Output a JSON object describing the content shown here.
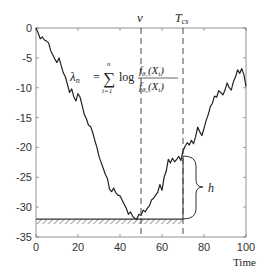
{
  "chart_data": {
    "type": "line",
    "title": "",
    "xlabel": "Time",
    "ylabel": "",
    "xlim": [
      0,
      100
    ],
    "ylim": [
      -35,
      0
    ],
    "xticks": [
      0,
      20,
      40,
      60,
      80,
      100
    ],
    "yticks": [
      0,
      -5,
      -10,
      -15,
      -20,
      -25,
      -30,
      -35
    ],
    "xtick_labels": [
      "0",
      "20",
      "40",
      "60",
      "80",
      "100"
    ],
    "ytick_labels": [
      "0",
      "-5",
      "-10",
      "-15",
      "-20",
      "-25",
      "-30",
      "-35"
    ],
    "grid": false,
    "series": [
      {
        "name": "lambda_n",
        "x": [
          0,
          1,
          2,
          3,
          4,
          5,
          6,
          7,
          8,
          9,
          10,
          11,
          12,
          13,
          14,
          15,
          16,
          17,
          18,
          19,
          20,
          21,
          22,
          23,
          24,
          25,
          26,
          27,
          28,
          29,
          30,
          31,
          32,
          33,
          34,
          35,
          36,
          37,
          38,
          39,
          40,
          41,
          42,
          43,
          44,
          45,
          46,
          47,
          48,
          49,
          50,
          51,
          52,
          53,
          54,
          55,
          56,
          57,
          58,
          59,
          60,
          61,
          62,
          63,
          64,
          65,
          66,
          67,
          68,
          69,
          70,
          71,
          72,
          73,
          74,
          75,
          76,
          77,
          78,
          79,
          80,
          81,
          82,
          83,
          84,
          85,
          86,
          87,
          88,
          89,
          90,
          91,
          92,
          93,
          94,
          95,
          96,
          97,
          98,
          99,
          100
        ],
        "values": [
          0,
          -0.8,
          -1.8,
          -1.5,
          -2.0,
          -2.2,
          -2.5,
          -3.8,
          -4.5,
          -5.2,
          -5.8,
          -5.0,
          -6.3,
          -7.5,
          -8.2,
          -9.5,
          -10.8,
          -10.2,
          -11.5,
          -12.2,
          -11.0,
          -11.6,
          -13.0,
          -14.5,
          -15.2,
          -16.3,
          -16.5,
          -17.5,
          -18.8,
          -20.0,
          -21.5,
          -22.5,
          -23.5,
          -24.5,
          -25.2,
          -27.0,
          -27.4,
          -26.8,
          -27.6,
          -28.0,
          -28.1,
          -28.8,
          -29.5,
          -30.2,
          -31.2,
          -30.8,
          -31.5,
          -31.9,
          -32.0,
          -31.2,
          -31.4,
          -30.5,
          -30.8,
          -30.2,
          -29.8,
          -28.8,
          -28.5,
          -28.0,
          -27.5,
          -26.2,
          -27.2,
          -25.0,
          -24.0,
          -22.0,
          -22.6,
          -21.8,
          -22.4,
          -22.0,
          -21.5,
          -22.2,
          -20.6,
          -19.8,
          -19.2,
          -19.6,
          -18.8,
          -19.4,
          -18.2,
          -16.6,
          -17.4,
          -18.0,
          -16.8,
          -15.5,
          -14.5,
          -13.2,
          -12.6,
          -11.4,
          -11.6,
          -10.5,
          -10.8,
          -11.2,
          -10.4,
          -9.2,
          -10.0,
          -10.4,
          -9.0,
          -8.2,
          -7.0,
          -7.6,
          -6.8,
          -7.8,
          -9.8
        ]
      }
    ],
    "annotations": [
      {
        "type": "vline",
        "x": 50,
        "style": "dashed",
        "label": "ν"
      },
      {
        "type": "vline",
        "x": 70,
        "style": "dashed",
        "label": "T_cs"
      },
      {
        "type": "hline",
        "y": -32,
        "x_range": [
          0,
          70
        ],
        "style": "solid-hatched",
        "label": "running minimum"
      },
      {
        "type": "segment",
        "x": 70,
        "y_range": [
          -32,
          -21.5
        ],
        "label": "h"
      },
      {
        "type": "brace",
        "x": 70,
        "y_range": [
          -32,
          -21.5
        ],
        "label": "h"
      },
      {
        "type": "text",
        "text": "λ_n = Σ_{i=1}^{n} log f_θ1(X_i) / f_θ0(X_i)"
      }
    ],
    "legend": null
  },
  "labels": {
    "nu": "ν",
    "tcs_main": "T",
    "tcs_sub": "cs",
    "h": "h",
    "xlabel": "Time",
    "formula": {
      "lhs": "λ",
      "lhs_sub": "n",
      "equals": "=",
      "sum": "∑",
      "sum_top": "n",
      "sum_bottom": "i=1",
      "log": "log",
      "num": "f",
      "num_sub": "θ₁",
      "num_arg": "(X",
      "num_arg_sub": "i",
      "num_close": ")",
      "den": "f",
      "den_sub": "θ₀",
      "den_arg": "(X",
      "den_arg_sub": "i",
      "den_close": ")"
    }
  },
  "colors": {
    "line": "#222222",
    "axis": "#666666",
    "text": "#333333"
  }
}
